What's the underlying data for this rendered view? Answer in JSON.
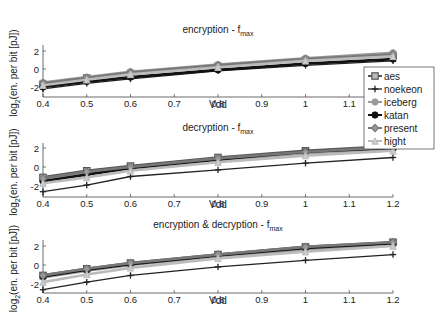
{
  "chart_data": [
    {
      "type": "line",
      "title": "encryption - f_max",
      "title_main": "encryption - f",
      "title_sub": "max",
      "xlabel": "Vdd",
      "ylabel": "log2(en. per bit [pJ])",
      "ylabel_pre": "log",
      "ylabel_sub": "2",
      "ylabel_post": "(en. per bit [pJ])",
      "xlim": [
        0.4,
        1.2
      ],
      "ylim": [
        -2.5,
        3
      ],
      "xticks": [
        "0.4",
        "0.5",
        "0.6",
        "0.7",
        "0.8",
        "0.9",
        "1",
        "1.1",
        "1.2"
      ],
      "yticks": [
        "2",
        "0",
        "-2"
      ],
      "x": [
        0.4,
        0.5,
        0.6,
        0.8,
        1.0,
        1.2
      ],
      "series": [
        {
          "name": "aes",
          "values": [
            -1.7,
            -1.0,
            -0.5,
            0.3,
            1.0,
            1.5
          ]
        },
        {
          "name": "noekeon",
          "values": [
            -2.2,
            -1.6,
            -1.1,
            -0.2,
            0.4,
            0.9
          ]
        },
        {
          "name": "iceberg",
          "values": [
            -1.5,
            -0.9,
            -0.3,
            0.5,
            1.2,
            1.8
          ]
        },
        {
          "name": "katan",
          "values": [
            -2.0,
            -1.4,
            -0.9,
            -0.1,
            0.6,
            1.1
          ]
        },
        {
          "name": "present",
          "values": [
            -1.6,
            -1.0,
            -0.4,
            0.4,
            1.1,
            1.6
          ]
        },
        {
          "name": "hight",
          "values": [
            -1.8,
            -1.2,
            -0.6,
            0.2,
            0.9,
            1.4
          ]
        }
      ],
      "legend_position": "right, overlapping"
    },
    {
      "type": "line",
      "title": "decryption - f_max",
      "title_main": "decryption - f",
      "title_sub": "max",
      "xlabel": "Vdd",
      "ylabel": "log2(en. per bit [pJ])",
      "ylabel_pre": "log",
      "ylabel_sub": "2",
      "ylabel_post": "(en. per bit [pJ])",
      "xlim": [
        0.4,
        1.2
      ],
      "ylim": [
        -2.5,
        3
      ],
      "xticks": [
        "0.4",
        "0.5",
        "0.6",
        "0.7",
        "0.8",
        "0.9",
        "1",
        "1.1",
        "1.2"
      ],
      "yticks": [
        "2",
        "0",
        "-2"
      ],
      "x": [
        0.4,
        0.5,
        0.6,
        0.8,
        1.0,
        1.2
      ],
      "series": [
        {
          "name": "aes",
          "values": [
            -1.1,
            -0.4,
            0.1,
            1.0,
            1.7,
            2.2
          ]
        },
        {
          "name": "noekeon",
          "values": [
            -2.6,
            -1.9,
            -1.0,
            -0.3,
            0.4,
            1.0
          ]
        },
        {
          "name": "iceberg",
          "values": [
            -1.3,
            -0.7,
            -0.2,
            0.7,
            1.4,
            1.9
          ]
        },
        {
          "name": "katan",
          "values": [
            -1.5,
            -0.8,
            -0.1,
            0.8,
            1.6,
            2.0
          ]
        },
        {
          "name": "present",
          "values": [
            -1.2,
            -0.5,
            0.0,
            0.9,
            1.6,
            2.1
          ]
        },
        {
          "name": "hight",
          "values": [
            -1.7,
            -1.1,
            -0.4,
            0.5,
            1.2,
            1.7
          ]
        }
      ]
    },
    {
      "type": "line",
      "title": "encryption & decryption - f_max",
      "title_main": "encryption & decryption - f",
      "title_sub": "max",
      "xlabel": "Vdd",
      "ylabel": "log2(en. per bit [pJ])",
      "ylabel_pre": "log",
      "ylabel_sub": "2",
      "ylabel_post": "(en. per bit [pJ])",
      "xlim": [
        0.4,
        1.2
      ],
      "ylim": [
        -2.5,
        3
      ],
      "xticks": [
        "0.4",
        "0.5",
        "0.6",
        "0.7",
        "0.8",
        "0.9",
        "1",
        "1.1",
        "1.2"
      ],
      "yticks": [
        "2",
        "0",
        "-2"
      ],
      "x": [
        0.4,
        0.5,
        0.6,
        0.8,
        1.0,
        1.2
      ],
      "series": [
        {
          "name": "aes",
          "values": [
            -1.1,
            -0.4,
            0.2,
            1.1,
            1.9,
            2.4
          ]
        },
        {
          "name": "noekeon",
          "values": [
            -2.6,
            -1.8,
            -1.1,
            -0.2,
            0.5,
            1.1
          ]
        },
        {
          "name": "iceberg",
          "values": [
            -1.3,
            -0.6,
            0.0,
            0.9,
            1.6,
            2.1
          ]
        },
        {
          "name": "katan",
          "values": [
            -1.2,
            -0.5,
            0.1,
            1.0,
            1.8,
            2.3
          ]
        },
        {
          "name": "present",
          "values": [
            -1.1,
            -0.4,
            0.2,
            1.1,
            1.9,
            2.4
          ]
        },
        {
          "name": "hight",
          "values": [
            -1.8,
            -1.0,
            -0.3,
            0.7,
            1.4,
            2.0
          ]
        }
      ]
    }
  ],
  "legend": {
    "entries": [
      {
        "name": "aes",
        "color": "#555555",
        "marker": "square"
      },
      {
        "name": "noekeon",
        "color": "#222222",
        "marker": "plus"
      },
      {
        "name": "iceberg",
        "color": "#9a9a9a",
        "marker": "star"
      },
      {
        "name": "katan",
        "color": "#111111",
        "marker": "star"
      },
      {
        "name": "present",
        "color": "#777777",
        "marker": "diamond"
      },
      {
        "name": "hight",
        "color": "#bbbbbb",
        "marker": "triangle"
      }
    ]
  }
}
